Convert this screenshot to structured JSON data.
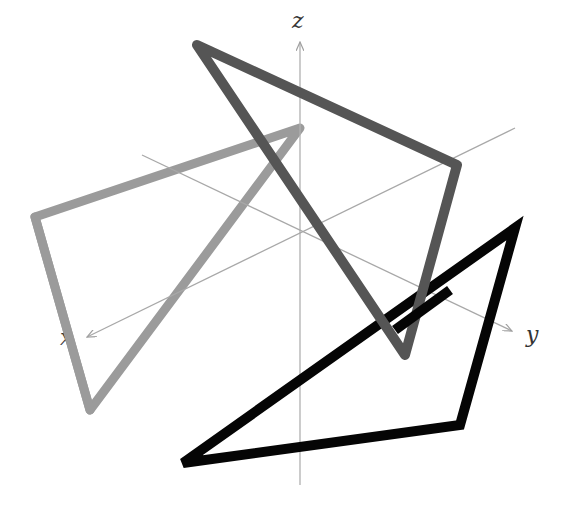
{
  "figure": {
    "axes": {
      "x": {
        "label": "x",
        "color": "#a8a8a8"
      },
      "y": {
        "label": "y",
        "color": "#a8a8a8"
      },
      "z": {
        "label": "z",
        "color": "#a8a8a8"
      }
    },
    "triangles": [
      {
        "name": "light-gray-triangle",
        "color": "#9b9b9b",
        "points": [
          [
            300,
            128
          ],
          [
            35,
            217
          ],
          [
            90,
            410
          ]
        ]
      },
      {
        "name": "dark-gray-triangle",
        "color": "#555555",
        "points": [
          [
            197,
            45
          ],
          [
            457,
            165
          ],
          [
            405,
            355
          ]
        ]
      },
      {
        "name": "black-triangle",
        "color": "#050505",
        "points": [
          [
            515,
            228
          ],
          [
            460,
            425
          ],
          [
            183,
            463
          ]
        ]
      }
    ]
  }
}
